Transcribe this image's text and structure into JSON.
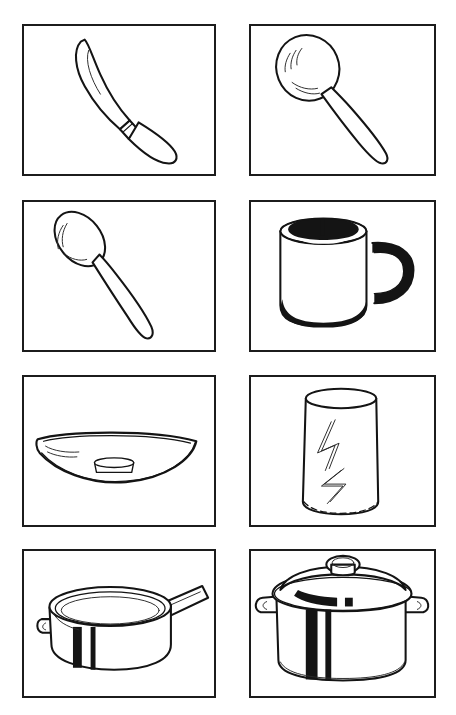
{
  "sheet": {
    "title": "Kitchen utensils picture card sheet",
    "background_color": "#ffffff",
    "ink_color": "#141414",
    "columns": 2,
    "rows": 4,
    "card_count": 8
  },
  "cards": [
    {
      "id": "knife",
      "label": "knife",
      "icon": "knife-icon",
      "description": "Table knife drawn diagonally, blade at upper left and handle at lower right with a bolster band at the middle",
      "row": 1,
      "column": "left"
    },
    {
      "id": "tablespoon",
      "label": "spoon",
      "icon": "spoon-icon",
      "description": "Large serving spoon with a round bowl at the upper left and a long handle running to the lower right",
      "row": 1,
      "column": "right"
    },
    {
      "id": "teaspoon",
      "label": "teaspoon",
      "icon": "teaspoon-icon",
      "description": "Small teaspoon with an oval bowl at the upper left and a slim tapering handle to the lower right",
      "row": 2,
      "column": "left"
    },
    {
      "id": "mug",
      "label": "mug",
      "icon": "mug-icon",
      "description": "Cylindrical mug with a dark inner rim, a dark loop handle on the right and heavy shading along the base",
      "row": 2,
      "column": "right"
    },
    {
      "id": "plate",
      "label": "plate",
      "icon": "plate-icon",
      "description": "Shallow plate seen almost edge on, with a small round foot beneath the centre",
      "row": 3,
      "column": "left"
    },
    {
      "id": "glass",
      "label": "glass",
      "icon": "glass-icon",
      "description": "Tall straight sided drinking glass with two zigzag highlight marks on the front",
      "row": 3,
      "column": "right"
    },
    {
      "id": "saucepan",
      "label": "saucepan",
      "icon": "saucepan-icon",
      "description": "Open saucepan with a long straight handle to the right, a small grip on the left and a dark vertical highlight stripe",
      "row": 4,
      "column": "left"
    },
    {
      "id": "pot",
      "label": "pot",
      "icon": "pot-icon",
      "description": "Covered cooking pot with a domed lid and knob, two side handles and dark vertical highlight stripes",
      "row": 4,
      "column": "right"
    }
  ]
}
